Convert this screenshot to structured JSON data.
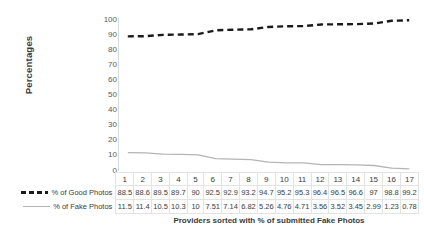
{
  "chart_data": {
    "type": "line",
    "title": "",
    "xlabel": "Providers sorted with % of submitted Fake Photos",
    "ylabel": "Percentages",
    "ylim": [
      0,
      100
    ],
    "yticks": [
      100,
      90,
      80,
      70,
      60,
      50,
      40,
      30,
      20,
      10,
      0
    ],
    "grid": false,
    "legend_position": "left-table",
    "categories": [
      "1",
      "2",
      "3",
      "4",
      "5",
      "6",
      "7",
      "8",
      "9",
      "10",
      "11",
      "12",
      "13",
      "14",
      "15",
      "16",
      "17"
    ],
    "series": [
      {
        "name": "% of Good Photos",
        "style": "dashed",
        "color": "#1a1a1a",
        "values": [
          88.5,
          88.6,
          89.5,
          89.7,
          90,
          92.5,
          92.9,
          93.2,
          94.7,
          95.2,
          95.3,
          96.4,
          96.5,
          96.6,
          97,
          98.8,
          99.2
        ],
        "labels": [
          "88.5",
          "88.6",
          "89.5",
          "89.7",
          "90",
          "92.5",
          "92.9",
          "93.2",
          "94.7",
          "95.2",
          "95.3",
          "96.4",
          "96.5",
          "96.6",
          "97",
          "98.8",
          "99.2"
        ]
      },
      {
        "name": "% of Fake Photos",
        "style": "solid",
        "color": "#b5b5b5",
        "values": [
          11.5,
          11.4,
          10.5,
          10.3,
          10,
          7.51,
          7.14,
          6.82,
          5.26,
          4.76,
          4.71,
          3.56,
          3.52,
          3.45,
          2.99,
          1.23,
          0.78
        ],
        "labels": [
          "11.5",
          "11.4",
          "10.5",
          "10.3",
          "10",
          "7.51",
          "7.14",
          "6.82",
          "5.26",
          "4.76",
          "4.71",
          "3.56",
          "3.52",
          "3.45",
          "2.99",
          "1.23",
          "0.78"
        ]
      }
    ]
  }
}
